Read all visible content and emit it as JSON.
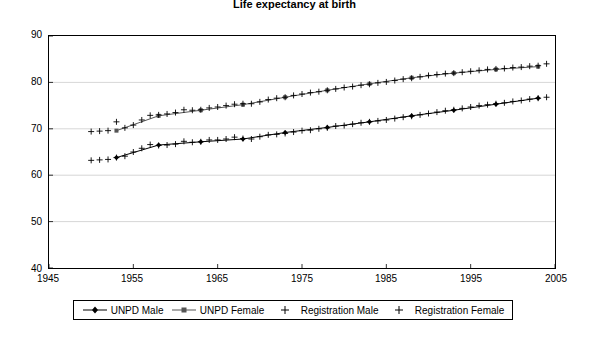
{
  "chart_data": {
    "type": "line",
    "title": "Life expectancy at birth",
    "xlabel": "",
    "ylabel": "",
    "xlim": [
      1945,
      2005
    ],
    "ylim": [
      40,
      90
    ],
    "xticks": [
      1945,
      1955,
      1965,
      1975,
      1985,
      1995,
      2005
    ],
    "yticks": [
      40,
      50,
      60,
      70,
      80,
      90
    ],
    "grid": false,
    "legend_position": "bottom",
    "series": [
      {
        "name": "UNPD Male",
        "marker": "diamond-line",
        "color": "#000000",
        "x": [
          1953,
          1958,
          1963,
          1968,
          1973,
          1978,
          1983,
          1988,
          1993,
          1998,
          2003
        ],
        "y": [
          63.8,
          66.5,
          67.2,
          67.8,
          69.2,
          70.3,
          71.5,
          72.8,
          74.0,
          75.3,
          76.6
        ]
      },
      {
        "name": "UNPD Female",
        "marker": "square-line",
        "color": "#555555",
        "x": [
          1953,
          1958,
          1963,
          1968,
          1973,
          1978,
          1983,
          1988,
          1993,
          1998,
          2003
        ],
        "y": [
          69.6,
          72.8,
          74.0,
          75.2,
          76.8,
          78.3,
          79.7,
          81.0,
          82.0,
          82.8,
          83.4
        ]
      },
      {
        "name": "Registration Male",
        "marker": "plus",
        "color": "#000000",
        "x": [
          1950,
          1951,
          1952,
          1953,
          1954,
          1955,
          1956,
          1957,
          1958,
          1959,
          1960,
          1961,
          1962,
          1963,
          1964,
          1965,
          1966,
          1967,
          1968,
          1969,
          1970,
          1971,
          1972,
          1973,
          1974,
          1975,
          1976,
          1977,
          1978,
          1979,
          1980,
          1981,
          1982,
          1983,
          1984,
          1985,
          1986,
          1987,
          1988,
          1989,
          1990,
          1991,
          1992,
          1993,
          1994,
          1995,
          1996,
          1997,
          1998,
          1999,
          2000,
          2001,
          2002,
          2003,
          2004
        ],
        "y": [
          63.2,
          63.3,
          63.4,
          63.8,
          64.1,
          65.0,
          65.8,
          66.6,
          66.4,
          66.5,
          66.7,
          67.3,
          67.1,
          67.2,
          67.6,
          67.6,
          67.8,
          68.2,
          67.9,
          67.8,
          68.3,
          68.7,
          68.8,
          69.0,
          69.3,
          69.6,
          69.7,
          70.0,
          70.2,
          70.6,
          70.7,
          71.0,
          71.3,
          71.5,
          71.7,
          71.9,
          72.2,
          72.5,
          72.7,
          73.0,
          73.3,
          73.6,
          73.9,
          74.1,
          74.4,
          74.7,
          75.0,
          75.2,
          75.4,
          75.6,
          75.9,
          76.1,
          76.4,
          76.6,
          76.8
        ]
      },
      {
        "name": "Registration Female",
        "marker": "plus",
        "color": "#000000",
        "x": [
          1950,
          1951,
          1952,
          1953,
          1954,
          1955,
          1956,
          1957,
          1958,
          1959,
          1960,
          1961,
          1962,
          1963,
          1964,
          1965,
          1966,
          1967,
          1968,
          1969,
          1970,
          1971,
          1972,
          1973,
          1974,
          1975,
          1976,
          1977,
          1978,
          1979,
          1980,
          1981,
          1982,
          1983,
          1984,
          1985,
          1986,
          1987,
          1988,
          1989,
          1990,
          1991,
          1992,
          1993,
          1994,
          1995,
          1996,
          1997,
          1998,
          1999,
          2000,
          2001,
          2002,
          2003,
          2004
        ],
        "y": [
          69.4,
          69.5,
          69.6,
          71.5,
          70.2,
          70.8,
          71.9,
          72.9,
          73.0,
          73.2,
          73.5,
          74.1,
          74.0,
          74.1,
          74.5,
          74.7,
          75.0,
          75.3,
          75.4,
          75.4,
          75.8,
          76.3,
          76.6,
          76.8,
          77.2,
          77.5,
          77.8,
          78.0,
          78.3,
          78.6,
          78.9,
          79.1,
          79.4,
          79.6,
          79.9,
          80.1,
          80.4,
          80.7,
          80.9,
          81.2,
          81.5,
          81.7,
          81.9,
          82.0,
          82.2,
          82.4,
          82.6,
          82.8,
          82.9,
          83.0,
          83.2,
          83.3,
          83.5,
          83.6,
          84.0
        ]
      }
    ]
  },
  "axis": {
    "y_labels": [
      "90",
      "80",
      "70",
      "60",
      "50",
      "40"
    ],
    "x_labels": [
      "1945",
      "1955",
      "1965",
      "1975",
      "1985",
      "1995",
      "2005"
    ]
  },
  "legend": {
    "items": [
      {
        "label": "UNPD Male"
      },
      {
        "label": "UNPD Female"
      },
      {
        "label": "Registration Male"
      },
      {
        "label": "Registration Female"
      }
    ]
  }
}
